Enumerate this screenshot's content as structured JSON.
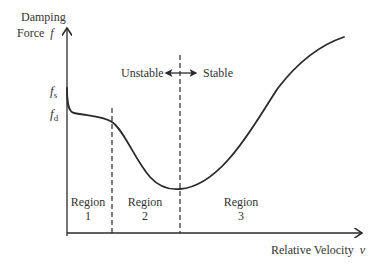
{
  "diagram": {
    "y_axis_label_line1": "Damping",
    "y_axis_label_line2": "Force",
    "y_axis_symbol": "f",
    "x_axis_label": "Relative Velocity",
    "x_axis_symbol": "v",
    "tick_fs": "f",
    "tick_fs_sub": "s",
    "tick_fd": "f",
    "tick_fd_sub": "d",
    "unstable_label": "Unstable",
    "stable_label": "Stable",
    "regions": [
      {
        "name": "Region",
        "number": "1"
      },
      {
        "name": "Region",
        "number": "2"
      },
      {
        "name": "Region",
        "number": "3"
      }
    ],
    "colors": {
      "line": "#2a2a2a",
      "text": "#333333"
    }
  }
}
